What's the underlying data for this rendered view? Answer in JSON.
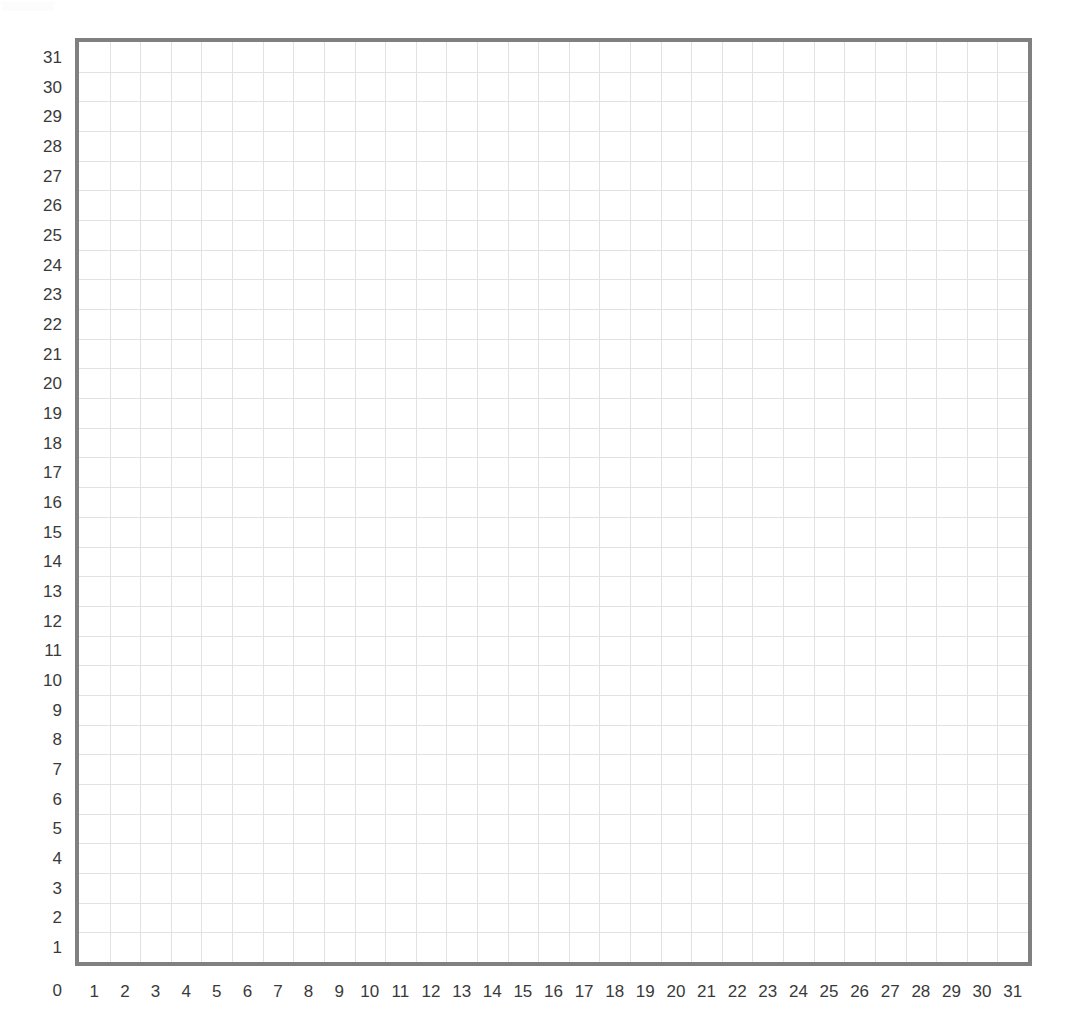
{
  "figure": {
    "title": "",
    "background_color": "#ffffff"
  },
  "axes": {
    "border_color": "#808080",
    "grid_color": "#e2e2e2",
    "label_color": "#3a3a3a",
    "origin_label": "0",
    "x_tick_labels": [
      "1",
      "2",
      "3",
      "4",
      "5",
      "6",
      "7",
      "8",
      "9",
      "10",
      "11",
      "12",
      "13",
      "14",
      "15",
      "16",
      "17",
      "18",
      "19",
      "20",
      "21",
      "22",
      "23",
      "24",
      "25",
      "26",
      "27",
      "28",
      "29",
      "30",
      "31"
    ],
    "y_tick_labels": [
      "31",
      "30",
      "29",
      "28",
      "27",
      "26",
      "25",
      "24",
      "23",
      "22",
      "21",
      "20",
      "19",
      "18",
      "17",
      "16",
      "15",
      "14",
      "13",
      "12",
      "11",
      "10",
      "9",
      "8",
      "7",
      "6",
      "5",
      "4",
      "3",
      "2",
      "1"
    ]
  },
  "chart_data": {
    "type": "scatter",
    "title": "",
    "subtitle": "",
    "xlabel": "",
    "ylabel": "",
    "xlim": [
      0,
      31
    ],
    "ylim": [
      0,
      31
    ],
    "xticks": [
      0,
      1,
      2,
      3,
      4,
      5,
      6,
      7,
      8,
      9,
      10,
      11,
      12,
      13,
      14,
      15,
      16,
      17,
      18,
      19,
      20,
      21,
      22,
      23,
      24,
      25,
      26,
      27,
      28,
      29,
      30,
      31
    ],
    "yticks": [
      0,
      1,
      2,
      3,
      4,
      5,
      6,
      7,
      8,
      9,
      10,
      11,
      12,
      13,
      14,
      15,
      16,
      17,
      18,
      19,
      20,
      21,
      22,
      23,
      24,
      25,
      26,
      27,
      28,
      29,
      30,
      31
    ],
    "grid": true,
    "grid_spacing": 1,
    "minor_grid": false,
    "legend": null,
    "legend_position": "none",
    "annotations": [],
    "series": [],
    "x": [],
    "values": [],
    "note": "Empty 31 x 31 square coordinate grid with no plotted data points."
  }
}
